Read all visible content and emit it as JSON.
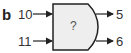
{
  "panel_label": "b",
  "gate": {
    "label": "?",
    "fill": "#eeeeee",
    "stroke": "#222222"
  },
  "inputs": [
    {
      "label": "10"
    },
    {
      "label": "11"
    }
  ],
  "outputs": [
    {
      "label": "5"
    },
    {
      "label": "6"
    }
  ]
}
